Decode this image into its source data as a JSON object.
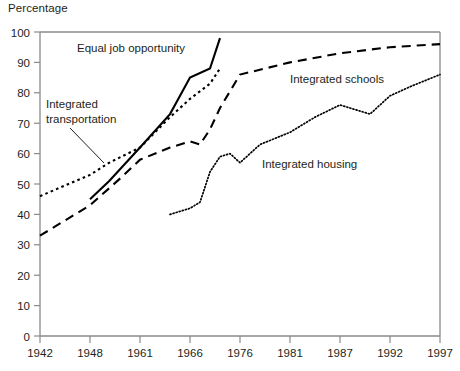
{
  "chart_data": {
    "type": "line",
    "title": "",
    "ylabel": "Percentage",
    "xlabel": "",
    "ylim": [
      0,
      100
    ],
    "grid": false,
    "legend_position": "inline-annotations",
    "y_ticks": [
      "0",
      "10",
      "20",
      "30",
      "40",
      "50",
      "60",
      "70",
      "80",
      "90",
      "100"
    ],
    "x_ticks": [
      "1942",
      "1948",
      "1961",
      "1966",
      "1976",
      "1981",
      "1987",
      "1992",
      "1997"
    ],
    "x_tick_values": [
      1942,
      1948,
      1961,
      1966,
      1976,
      1981,
      1987,
      1992,
      1997
    ],
    "series": [
      {
        "name": "Equal job opportunity",
        "style": "solid",
        "color": "#000000",
        "x": [
          1948,
          1953,
          1961,
          1964,
          1966,
          1970,
          1972
        ],
        "y": [
          45,
          51,
          62,
          73,
          85,
          88,
          98
        ]
      },
      {
        "name": "Integrated transportation",
        "style": "dotted",
        "color": "#000000",
        "x": [
          1942,
          1948,
          1953,
          1961,
          1964,
          1966,
          1970,
          1972
        ],
        "y": [
          46,
          53,
          57,
          62,
          72,
          78,
          83,
          88
        ]
      },
      {
        "name": "Integrated schools",
        "style": "dashed",
        "color": "#000000",
        "x": [
          1942,
          1948,
          1956,
          1961,
          1964,
          1966,
          1968,
          1970,
          1972,
          1976,
          1981,
          1987,
          1992,
          1997
        ],
        "y": [
          33,
          43,
          52,
          58,
          62,
          64,
          63,
          68,
          75,
          86,
          90,
          93,
          95,
          96
        ]
      },
      {
        "name": "Integrated housing",
        "style": "dotted",
        "color": "#000000",
        "x": [
          1964,
          1966,
          1968,
          1970,
          1972,
          1974,
          1976,
          1978,
          1981,
          1984,
          1987,
          1990,
          1992,
          1994,
          1997
        ],
        "y": [
          40,
          42,
          44,
          54,
          59,
          60,
          57,
          63,
          67,
          72,
          76,
          73,
          79,
          82,
          86
        ]
      }
    ],
    "annotations": [
      {
        "text": "Equal job opportunity",
        "series": "Equal job opportunity"
      },
      {
        "text": "Integrated transportation",
        "series": "Integrated transportation"
      },
      {
        "text": "Integrated schools",
        "series": "Integrated schools"
      },
      {
        "text": "Integrated housing",
        "series": "Integrated housing"
      }
    ]
  },
  "chart": {
    "y_axis_title": "Percentage",
    "labels": {
      "equal_job_opportunity": "Equal job opportunity",
      "integrated_transportation_line1": "Integrated",
      "integrated_transportation_line2": "transportation",
      "integrated_schools": "Integrated schools",
      "integrated_housing": "Integrated housing"
    },
    "y_ticks": {
      "t0": "0",
      "t10": "10",
      "t20": "20",
      "t30": "30",
      "t40": "40",
      "t50": "50",
      "t60": "60",
      "t70": "70",
      "t80": "80",
      "t90": "90",
      "t100": "100"
    },
    "x_ticks": {
      "t1942": "1942",
      "t1948": "1948",
      "t1961": "1961",
      "t1966": "1966",
      "t1976": "1976",
      "t1981": "1981",
      "t1987": "1987",
      "t1992": "1992",
      "t1997": "1997"
    },
    "colors": {
      "axis": "#8a8a8a",
      "ink": "#231f20",
      "series": "#000000"
    }
  }
}
